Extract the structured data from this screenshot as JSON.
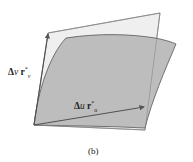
{
  "figure": {
    "caption": "(b)",
    "labels": {
      "v_vector": {
        "delta": "Δ",
        "var": "v",
        "vec": "r",
        "sup": "*",
        "sub": "v"
      },
      "u_vector": {
        "delta": "Δ",
        "var": "u",
        "vec": "r",
        "sup": "*",
        "sub": "u"
      }
    },
    "colors": {
      "tangent_plane_fill": "#ededed",
      "surface_patch_fill": "#bdbdbd",
      "stroke": "#555555"
    }
  }
}
